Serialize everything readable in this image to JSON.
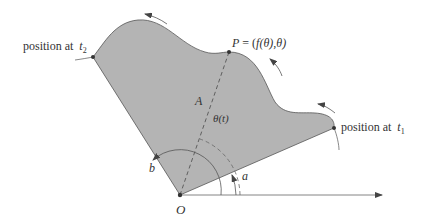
{
  "figure": {
    "region_label": "A",
    "origin_label": "O",
    "point_label": "P = (f(θ),θ)",
    "point_label_parts": {
      "P": "P",
      "eq": " = (",
      "f": "f",
      "arg": "(θ),θ)"
    },
    "angle_label": "θ(t)",
    "angle_a_label": "a",
    "angle_b_label": "b",
    "t1_label": {
      "prefix": "position at ",
      "var": "t",
      "sub": "1"
    },
    "t2_label": {
      "prefix": "position at ",
      "var": "t",
      "sub": "2"
    }
  },
  "colors": {
    "region_fill": "#b4b4b4",
    "line": "#555555",
    "text": "#333333"
  }
}
